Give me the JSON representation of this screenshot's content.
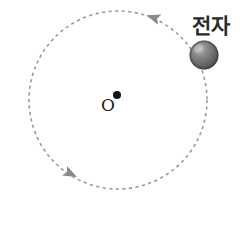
{
  "diagram": {
    "background_color": "#ffffff",
    "center": {
      "label": "O",
      "label_color": "#1b1b1b",
      "dot_color": "#151515",
      "dot_x": 117,
      "dot_y": 95,
      "dot_radius": 4,
      "label_x": 108,
      "label_y": 111
    },
    "orbit": {
      "name": "dashed-circular-orbit",
      "center_x": 118,
      "center_y": 100,
      "radius": 89,
      "stroke_color": "#9a9a9a",
      "stroke_width": 1.6,
      "dash_pattern": "3.2 3.4",
      "style": "dashed"
    },
    "direction_arrows": [
      {
        "name": "orbit-arrow-top",
        "x": 155,
        "y": 18,
        "rotation": 198,
        "color": "#8a8a8a",
        "size": 9
      },
      {
        "name": "orbit-arrow-bottom-left",
        "x": 69,
        "y": 173,
        "rotation": 27,
        "color": "#8a8a8a",
        "size": 9
      }
    ],
    "electron": {
      "label": "전자",
      "label_x": 192,
      "label_y": 33,
      "label_color": "#2a2a2a",
      "sphere_center_x": 204,
      "sphere_center_y": 55,
      "sphere_radius": 14.5,
      "sphere_base_color": "#6f6f6f",
      "sphere_highlight_color": "#b9b9b9",
      "sphere_shadow_color": "#4a4a4a"
    }
  }
}
